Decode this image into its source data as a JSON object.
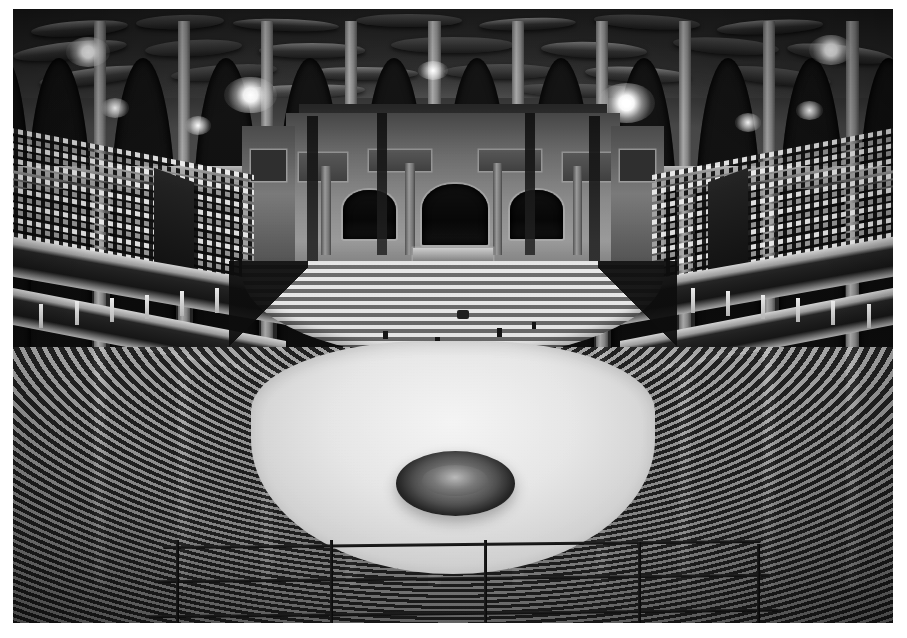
{
  "image": {
    "kind": "photograph",
    "medium": "black-and-white halftone print",
    "subject": "Royal Albert Hall auditorium interior, empty, viewed from upper circle",
    "orientation": "landscape",
    "border_color": "#ffffff",
    "tone_dark": "#151513",
    "tone_mid": "#6e6c64",
    "tone_light": "#efeee6",
    "caption": ""
  },
  "scene": {
    "ceiling": {
      "name": "domed-ceiling",
      "description": "Dark dome fitted with elliptical acoustic diffusers (mushrooms)",
      "diffuser_count": 22
    },
    "gallery": {
      "name": "upper-gallery-arcade",
      "description": "Arcade of round-headed arches with lit lamps between piers",
      "arch_count": 13,
      "lamp_count": 9
    },
    "stage": {
      "name": "stage-back-wall",
      "description": "Ornate back wall with three arched niches below the covered organ screen",
      "niche_count": 3,
      "panel_count": 4
    },
    "choir": {
      "name": "choir-stalls",
      "description": "Curved tiered choir seating fanning out in front of the stage",
      "row_count": 11
    },
    "seating_left": {
      "name": "left-tiered-seating",
      "description": "Steeply banked rows of empty seats on the left side",
      "row_count": 16
    },
    "seating_right": {
      "name": "right-tiered-seating",
      "description": "Steeply banked rows of empty seats on the right side",
      "row_count": 16
    },
    "boxes": {
      "name": "balcony-box-tiers",
      "description": "Two continuous horseshoe tiers of private boxes with slender columns",
      "tier_count": 2
    },
    "stalls": {
      "name": "lower-stalls-seating",
      "description": "Concentric curved rows of stall seats encircling the arena floor",
      "row_count": 14
    },
    "arena": {
      "name": "arena-floor",
      "description": "Pale open arena floor with a circular floral display at the centre"
    },
    "fountain": {
      "name": "central-floral-display",
      "description": "Dark ring of massed flowers around a low central basin"
    },
    "railing": {
      "name": "foreground-railing",
      "description": "Metal safety railing in the immediate foreground with three horizontal rails",
      "horizontal_rail_count": 3,
      "vertical_post_count": 5
    }
  }
}
